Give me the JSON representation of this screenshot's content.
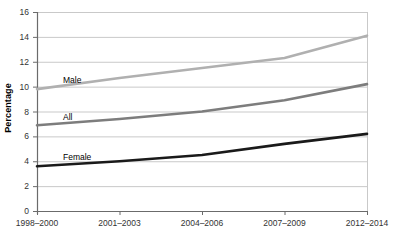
{
  "chart_data": {
    "type": "line",
    "title": "",
    "xlabel": "",
    "ylabel": "Percentage",
    "categories": [
      "1998–2000",
      "2001–2003",
      "2004–2006",
      "2007–2009",
      "2012–2014"
    ],
    "ylim": [
      0,
      16
    ],
    "ytick_step": 2,
    "yticks": [
      "16",
      "14",
      "12",
      "10",
      "8",
      "6",
      "4",
      "2",
      "0"
    ],
    "grid": "horizontal",
    "legend_position": "inline-series-labels",
    "series": [
      {
        "name": "Male",
        "color": "#b0b0b0",
        "values": [
          9.8,
          10.7,
          11.5,
          12.3,
          14.1
        ]
      },
      {
        "name": "All",
        "color": "#7d7d7d",
        "values": [
          6.9,
          7.4,
          8.0,
          8.9,
          10.2
        ]
      },
      {
        "name": "Female",
        "color": "#1a1a1a",
        "values": [
          3.6,
          4.0,
          4.5,
          5.4,
          6.2
        ]
      }
    ]
  },
  "axis": {
    "line_color": "#6b6b6b",
    "grid_color": "#c9c9c9"
  }
}
